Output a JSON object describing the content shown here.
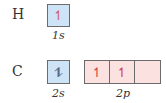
{
  "diagram": {
    "type": "orbital-box-diagram",
    "rows": [
      {
        "element": "H",
        "subshells": [
          {
            "label": "1s",
            "orbitals": [
              {
                "electrons": "↿"
              }
            ],
            "fill_color": "#cfe3f6"
          }
        ]
      },
      {
        "element": "C",
        "subshells": [
          {
            "label": "2s",
            "orbitals": [
              {
                "electrons": "⥮"
              }
            ],
            "fill_color": "#cfe3f6"
          },
          {
            "label": "2p",
            "orbitals": [
              {
                "electrons": "↿"
              },
              {
                "electrons": "↿"
              },
              {
                "electrons": ""
              }
            ],
            "fill_color": "#fbe1df"
          }
        ]
      }
    ]
  },
  "labels": {
    "h_element": "H",
    "c_element": "C",
    "h_1s": "1s",
    "c_2s": "2s",
    "c_2p": "2p"
  },
  "arrows": {
    "h_1s": "↿",
    "c_2s": "⥮",
    "c_2p_1": "↿",
    "c_2p_2": "↿",
    "c_2p_3": ""
  }
}
